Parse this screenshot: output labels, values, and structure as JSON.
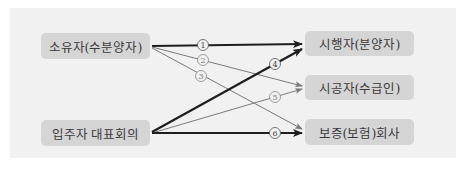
{
  "diagram": {
    "sources": [
      {
        "id": "owner",
        "label": "소유자(수분양자)"
      },
      {
        "id": "residents",
        "label": "입주자 대표회의"
      }
    ],
    "targets": [
      {
        "id": "developer",
        "label": "시행자(분양자)"
      },
      {
        "id": "contractor",
        "label": "시공자(수급인)"
      },
      {
        "id": "guarantor",
        "label": "보증(보험)회사"
      }
    ],
    "edges": [
      {
        "num": "1",
        "from": "owner",
        "to": "developer",
        "weight": "bold"
      },
      {
        "num": "2",
        "from": "owner",
        "to": "contractor",
        "weight": "thin"
      },
      {
        "num": "3",
        "from": "owner",
        "to": "guarantor",
        "weight": "thin"
      },
      {
        "num": "4",
        "from": "residents",
        "to": "developer",
        "weight": "bold"
      },
      {
        "num": "5",
        "from": "residents",
        "to": "contractor",
        "weight": "thin"
      },
      {
        "num": "6",
        "from": "residents",
        "to": "guarantor",
        "weight": "bold"
      }
    ],
    "colors": {
      "bold_line": "#1e1e1e",
      "thin_line": "#7a7a7a",
      "node_fill": "#d5d5d5",
      "panel": "#f1f1f1"
    }
  }
}
